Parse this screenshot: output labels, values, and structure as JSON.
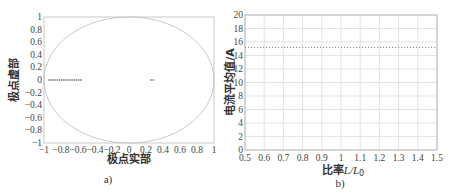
{
  "chart_data": [
    {
      "type": "scatter",
      "panel": "a)",
      "title": "",
      "xlabel": "极点实部",
      "ylabel": "极点虚部",
      "xlim": [
        -1,
        1
      ],
      "ylim": [
        -1,
        1
      ],
      "xticks": [
        "-1",
        "-0.8",
        "-0.6",
        "-0.4",
        "-0.2",
        "0",
        "0.2",
        "0.4",
        "0.6",
        "0.8",
        "1"
      ],
      "yticks": [
        "1",
        "0.8",
        "0.6",
        "0.4",
        "0.2",
        "0",
        "-0.2",
        "-0.4",
        "-0.6",
        "-0.8",
        "-1"
      ],
      "grid": false,
      "annotations": [
        "unit circle"
      ],
      "series": [
        {
          "name": "poles cluster 1",
          "x_range": [
            -0.95,
            -0.55
          ],
          "y": 0
        },
        {
          "name": "poles cluster 2",
          "x_range": [
            0.25,
            0.3
          ],
          "y": 0
        }
      ],
      "caption": "a)"
    },
    {
      "type": "line",
      "panel": "b)",
      "title": "",
      "xlabel": "比率L/L0",
      "ylabel": "电流平均值/A",
      "xlim": [
        0.5,
        1.5
      ],
      "ylim": [
        0,
        20
      ],
      "xticks": [
        "0.5",
        "0.6",
        "0.7",
        "0.8",
        "0.9",
        "1",
        "1.1",
        "1.2",
        "1.3",
        "1.4",
        "1.5"
      ],
      "yticks": [
        "20",
        "18",
        "16",
        "14",
        "12",
        "10",
        "8",
        "6",
        "4",
        "2",
        "0"
      ],
      "grid": true,
      "series": [
        {
          "name": "电流平均值",
          "style": "dotted",
          "x": [
            0.5,
            0.6,
            0.7,
            0.8,
            0.9,
            1.0,
            1.1,
            1.2,
            1.3,
            1.4,
            1.5
          ],
          "values": [
            15.2,
            15.2,
            15.2,
            15.2,
            15.2,
            15.2,
            15.2,
            15.2,
            15.2,
            15.2,
            15.2
          ]
        }
      ],
      "caption": "b)"
    }
  ],
  "labels": {
    "a_xlabel": "极点实部",
    "a_ylabel": "极点虚部",
    "a_caption": "a)",
    "b_xlabel_prefix": "比率",
    "b_xlabel_var": "L/L",
    "b_xlabel_sub": "0",
    "b_ylabel": "电流平均值/A",
    "b_caption": "b)"
  }
}
